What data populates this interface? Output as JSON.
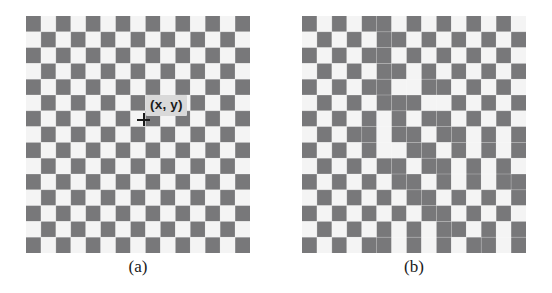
{
  "figure": {
    "background_color": "#ffffff",
    "panels": [
      {
        "id": "a",
        "caption": "(a)",
        "coord_label": "(x, y)",
        "label_background": "#d9d9d9",
        "marker": "crosshair",
        "board": {
          "type": "checkerboard",
          "rows": 15,
          "cols": 15,
          "distorted": false,
          "light_color": "#f4f4f4",
          "dark_color": "#78787a"
        }
      },
      {
        "id": "b",
        "caption": "(b)",
        "coord_label": "(x', y')",
        "label_background": "#d9d9d9",
        "marker": "crosshair",
        "board": {
          "type": "checkerboard",
          "rows": 15,
          "cols": 15,
          "distorted": true,
          "light_color": "#f4f4f4",
          "dark_color": "#78787a"
        }
      }
    ]
  },
  "chart_data": {
    "type": "heatmap",
    "title": "",
    "xlabel": "",
    "ylabel": "",
    "grid": false,
    "legend": null,
    "annotations": [
      {
        "panel": "a",
        "text": "(x, y)",
        "x": 7,
        "y": 6
      },
      {
        "panel": "a",
        "text": "(a)",
        "x": 7,
        "y": 15
      },
      {
        "panel": "b",
        "text": "(x', y')",
        "x": 7,
        "y": 6
      },
      {
        "panel": "b",
        "text": "(b)",
        "x": 7,
        "y": 15
      }
    ],
    "panels": [
      {
        "name": "(a)",
        "rows": 15,
        "cols": 15,
        "colormap": {
          "0": "#f4f4f4",
          "1": "#78787a"
        },
        "values": [
          [
            1,
            0,
            1,
            0,
            1,
            0,
            1,
            0,
            1,
            0,
            1,
            0,
            1,
            0,
            1
          ],
          [
            0,
            1,
            0,
            1,
            0,
            1,
            0,
            1,
            0,
            1,
            0,
            1,
            0,
            1,
            0
          ],
          [
            1,
            0,
            1,
            0,
            1,
            0,
            1,
            0,
            1,
            0,
            1,
            0,
            1,
            0,
            1
          ],
          [
            0,
            1,
            0,
            1,
            0,
            1,
            0,
            1,
            0,
            1,
            0,
            1,
            0,
            1,
            0
          ],
          [
            1,
            0,
            1,
            0,
            1,
            0,
            1,
            0,
            1,
            0,
            1,
            0,
            1,
            0,
            1
          ],
          [
            0,
            1,
            0,
            1,
            0,
            1,
            0,
            1,
            0,
            1,
            0,
            1,
            0,
            1,
            0
          ],
          [
            1,
            0,
            1,
            0,
            1,
            0,
            1,
            0,
            1,
            0,
            1,
            0,
            1,
            0,
            1
          ],
          [
            0,
            1,
            0,
            1,
            0,
            1,
            0,
            1,
            0,
            1,
            0,
            1,
            0,
            1,
            0
          ],
          [
            1,
            0,
            1,
            0,
            1,
            0,
            1,
            0,
            1,
            0,
            1,
            0,
            1,
            0,
            1
          ],
          [
            0,
            1,
            0,
            1,
            0,
            1,
            0,
            1,
            0,
            1,
            0,
            1,
            0,
            1,
            0
          ],
          [
            1,
            0,
            1,
            0,
            1,
            0,
            1,
            0,
            1,
            0,
            1,
            0,
            1,
            0,
            1
          ],
          [
            0,
            1,
            0,
            1,
            0,
            1,
            0,
            1,
            0,
            1,
            0,
            1,
            0,
            1,
            0
          ],
          [
            1,
            0,
            1,
            0,
            1,
            0,
            1,
            0,
            1,
            0,
            1,
            0,
            1,
            0,
            1
          ],
          [
            0,
            1,
            0,
            1,
            0,
            1,
            0,
            1,
            0,
            1,
            0,
            1,
            0,
            1,
            0
          ],
          [
            1,
            0,
            1,
            0,
            1,
            0,
            1,
            0,
            1,
            0,
            1,
            0,
            1,
            0,
            1
          ]
        ]
      },
      {
        "name": "(b)",
        "rows": 15,
        "cols": 15,
        "colormap": {
          "0": "#f4f4f4",
          "1": "#78787a"
        },
        "values": [
          [
            1,
            0,
            1,
            0,
            1,
            1,
            0,
            1,
            0,
            1,
            0,
            1,
            0,
            1,
            0
          ],
          [
            0,
            1,
            0,
            1,
            0,
            1,
            1,
            0,
            1,
            0,
            1,
            0,
            1,
            0,
            1
          ],
          [
            1,
            0,
            1,
            0,
            1,
            1,
            0,
            1,
            0,
            1,
            0,
            1,
            0,
            1,
            0
          ],
          [
            0,
            1,
            0,
            1,
            0,
            1,
            1,
            0,
            1,
            0,
            1,
            0,
            1,
            0,
            1
          ],
          [
            1,
            0,
            1,
            0,
            1,
            1,
            0,
            0,
            1,
            1,
            0,
            1,
            0,
            1,
            0
          ],
          [
            0,
            1,
            0,
            1,
            0,
            1,
            1,
            1,
            0,
            0,
            1,
            0,
            1,
            0,
            1
          ],
          [
            1,
            0,
            1,
            0,
            1,
            0,
            1,
            0,
            1,
            1,
            0,
            1,
            0,
            1,
            0
          ],
          [
            0,
            1,
            0,
            1,
            1,
            0,
            1,
            1,
            0,
            1,
            1,
            0,
            1,
            0,
            1
          ],
          [
            1,
            0,
            1,
            0,
            1,
            0,
            0,
            1,
            1,
            0,
            1,
            0,
            1,
            0,
            1
          ],
          [
            0,
            1,
            0,
            1,
            0,
            1,
            1,
            0,
            1,
            1,
            0,
            1,
            0,
            1,
            0
          ],
          [
            1,
            0,
            1,
            0,
            1,
            0,
            1,
            1,
            0,
            1,
            0,
            1,
            0,
            1,
            1
          ],
          [
            0,
            1,
            0,
            1,
            0,
            1,
            0,
            1,
            1,
            0,
            1,
            0,
            1,
            0,
            1
          ],
          [
            1,
            0,
            1,
            0,
            1,
            0,
            1,
            0,
            1,
            1,
            0,
            1,
            0,
            1,
            0
          ],
          [
            0,
            1,
            0,
            1,
            0,
            1,
            0,
            1,
            0,
            1,
            1,
            0,
            1,
            0,
            1
          ],
          [
            1,
            0,
            1,
            0,
            1,
            1,
            0,
            1,
            0,
            1,
            0,
            1,
            1,
            0,
            1
          ]
        ]
      }
    ]
  }
}
